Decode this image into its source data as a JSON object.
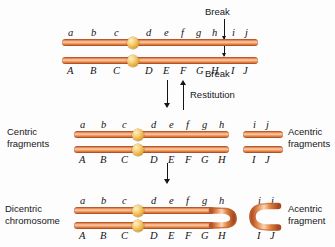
{
  "figure": {
    "colors": {
      "chromatid_dark": "#b8562b",
      "chromatid_mid": "#e1813f",
      "chromatid_light": "#fbd3b6",
      "centromere": "#e8ae44",
      "arrow": "#141417",
      "text": "#17171a",
      "background": "#fdfdfd"
    }
  },
  "panels": {
    "top": {
      "name": "intact-chromosome",
      "upper_genes": [
        "a",
        "b",
        "c",
        "d",
        "e",
        "f",
        "g",
        "h",
        "i",
        "j"
      ],
      "lower_genes": [
        "A",
        "B",
        "C",
        "D",
        "E",
        "F",
        "G",
        "H",
        "I",
        "J"
      ],
      "break_label_upper": "Break",
      "break_label_lower": "Break"
    },
    "transition_top": {
      "down_label": "",
      "up_label": "Restitution"
    },
    "middle": {
      "name": "broken-fragments",
      "left_label_line1": "Centric",
      "left_label_line2": "fragments",
      "right_label_line1": "Acentric",
      "right_label_line2": "fragments",
      "centric_upper_genes": [
        "a",
        "b",
        "c",
        "d",
        "e",
        "f",
        "g",
        "h"
      ],
      "centric_lower_genes": [
        "A",
        "B",
        "C",
        "D",
        "E",
        "F",
        "G",
        "H"
      ],
      "acentric_upper_genes": [
        "i",
        "j"
      ],
      "acentric_lower_genes": [
        "I",
        "J"
      ]
    },
    "bottom": {
      "name": "dicentric-chromosome",
      "left_label_line1": "Dicentric",
      "left_label_line2": "chromosome",
      "right_label_line1": "Acentric",
      "right_label_line2": "fragment",
      "upper_genes": [
        "a",
        "b",
        "c",
        "d",
        "e",
        "f",
        "g",
        "h"
      ],
      "lower_genes": [
        "A",
        "B",
        "C",
        "D",
        "E",
        "F",
        "G",
        "H"
      ],
      "acentric_upper_genes": [
        "i",
        "j"
      ],
      "acentric_lower_genes": [
        "I",
        "J"
      ]
    }
  },
  "gene_positions": {
    "top_upper": [
      {
        "t": "a",
        "x": 68
      },
      {
        "t": "b",
        "x": 91
      },
      {
        "t": "c",
        "x": 114
      },
      {
        "t": "d",
        "x": 146
      },
      {
        "t": "e",
        "x": 164
      },
      {
        "t": "f",
        "x": 181
      },
      {
        "t": "g",
        "x": 196
      },
      {
        "t": "h",
        "x": 212
      },
      {
        "t": "i",
        "x": 232
      },
      {
        "t": "j",
        "x": 245
      }
    ],
    "top_lower": [
      {
        "t": "A",
        "x": 67
      },
      {
        "t": "B",
        "x": 90
      },
      {
        "t": "C",
        "x": 113
      },
      {
        "t": "D",
        "x": 145
      },
      {
        "t": "E",
        "x": 163
      },
      {
        "t": "F",
        "x": 180
      },
      {
        "t": "G",
        "x": 196
      },
      {
        "t": "H",
        "x": 211
      },
      {
        "t": "I",
        "x": 231
      },
      {
        "t": "J",
        "x": 243
      }
    ],
    "mid_upper": [
      {
        "t": "a",
        "x": 80
      },
      {
        "t": "b",
        "x": 101
      },
      {
        "t": "c",
        "x": 122
      },
      {
        "t": "d",
        "x": 151
      },
      {
        "t": "e",
        "x": 169
      },
      {
        "t": "f",
        "x": 186
      },
      {
        "t": "g",
        "x": 202
      },
      {
        "t": "h",
        "x": 219
      },
      {
        "t": "i",
        "x": 253
      },
      {
        "t": "j",
        "x": 266
      }
    ],
    "mid_lower": [
      {
        "t": "A",
        "x": 79
      },
      {
        "t": "B",
        "x": 100
      },
      {
        "t": "C",
        "x": 121
      },
      {
        "t": "D",
        "x": 150
      },
      {
        "t": "E",
        "x": 168
      },
      {
        "t": "F",
        "x": 185
      },
      {
        "t": "G",
        "x": 201
      },
      {
        "t": "H",
        "x": 218
      },
      {
        "t": "I",
        "x": 252
      },
      {
        "t": "J",
        "x": 265
      }
    ],
    "bot_upper": [
      {
        "t": "a",
        "x": 80
      },
      {
        "t": "b",
        "x": 101
      },
      {
        "t": "c",
        "x": 122
      },
      {
        "t": "d",
        "x": 151
      },
      {
        "t": "e",
        "x": 169
      },
      {
        "t": "f",
        "x": 186
      },
      {
        "t": "g",
        "x": 202
      },
      {
        "t": "h",
        "x": 219
      },
      {
        "t": "i",
        "x": 258
      },
      {
        "t": "j",
        "x": 271
      }
    ],
    "bot_lower": [
      {
        "t": "A",
        "x": 79
      },
      {
        "t": "B",
        "x": 100
      },
      {
        "t": "C",
        "x": 121
      },
      {
        "t": "D",
        "x": 150
      },
      {
        "t": "E",
        "x": 168
      },
      {
        "t": "F",
        "x": 185
      },
      {
        "t": "G",
        "x": 201
      },
      {
        "t": "H",
        "x": 218
      },
      {
        "t": "I",
        "x": 257
      },
      {
        "t": "J",
        "x": 270
      }
    ]
  }
}
